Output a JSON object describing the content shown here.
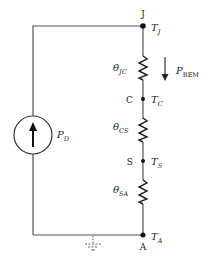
{
  "diagram": {
    "type": "thermal-equivalent-circuit",
    "nodes": [
      {
        "id": "J",
        "label": "J",
        "temp_symbol": "T",
        "temp_sub": "J"
      },
      {
        "id": "C",
        "label": "C",
        "temp_symbol": "T",
        "temp_sub": "C"
      },
      {
        "id": "S",
        "label": "S",
        "temp_symbol": "T",
        "temp_sub": "S"
      },
      {
        "id": "A",
        "label": "A",
        "temp_symbol": "T",
        "temp_sub": "A"
      }
    ],
    "resistors": [
      {
        "id": "theta_jc",
        "symbol": "θ",
        "sub": "JC",
        "from": "J",
        "to": "C"
      },
      {
        "id": "theta_cs",
        "symbol": "θ",
        "sub": "CS",
        "from": "C",
        "to": "S"
      },
      {
        "id": "theta_sa",
        "symbol": "θ",
        "sub": "SA",
        "from": "S",
        "to": "A"
      }
    ],
    "source": {
      "symbol": "P",
      "sub": "D",
      "kind": "current-source",
      "direction": "up"
    },
    "flow": {
      "symbol": "P",
      "sub": "REM",
      "direction": "down"
    },
    "ground": {
      "node": "A",
      "style": "dashed"
    },
    "colors": {
      "wire": "#555555",
      "component": "#222222",
      "node": "#111111"
    }
  }
}
